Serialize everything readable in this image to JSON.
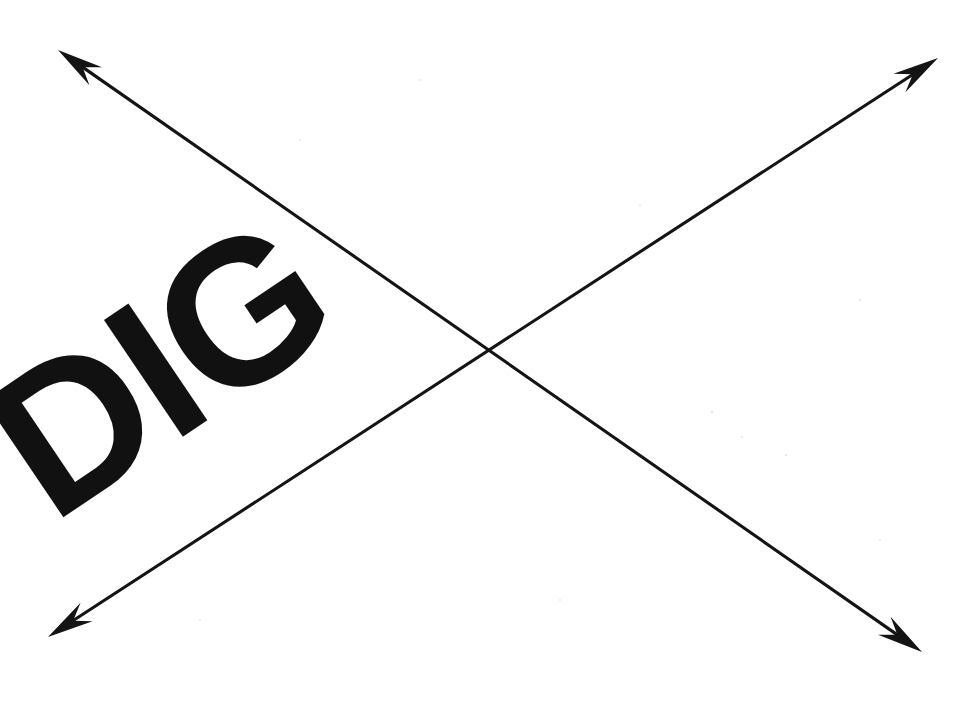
{
  "figure": {
    "title": "DIG",
    "background_color": "#ffffff",
    "ink_color": "#141414",
    "text": {
      "word": "DIG",
      "color": "#111111",
      "rotation_degrees": -34,
      "font_size_px": 205,
      "anchor_x": 52,
      "anchor_y": 525
    },
    "annotations": {
      "line_count": "2",
      "arrowhead_count": "4",
      "shape_description": "X",
      "line_width_px": "3"
    },
    "arrows": [
      {
        "name": "arrow-down-right",
        "label": "Descending diagonal double arrow",
        "x1": 58,
        "y1": 50,
        "x2": 922,
        "y2": 652,
        "double_headed": "true"
      },
      {
        "name": "arrow-up-right",
        "label": "Ascending diagonal double arrow",
        "x1": 48,
        "y1": 637,
        "x2": 938,
        "y2": 58,
        "double_headed": "true"
      }
    ],
    "crossing_point": {
      "x": 488,
      "y": 352,
      "label": "Intersection"
    },
    "specks": [
      {
        "x": 712,
        "y": 412,
        "r": 1.4
      },
      {
        "x": 786,
        "y": 455,
        "r": 1.2
      },
      {
        "x": 742,
        "y": 437,
        "r": 1.0
      },
      {
        "x": 640,
        "y": 205,
        "r": 1.1
      },
      {
        "x": 300,
        "y": 140,
        "r": 1.0
      },
      {
        "x": 860,
        "y": 300,
        "r": 1.2
      },
      {
        "x": 200,
        "y": 620,
        "r": 1.1
      },
      {
        "x": 560,
        "y": 600,
        "r": 1.0
      },
      {
        "x": 420,
        "y": 80,
        "r": 1.0
      },
      {
        "x": 880,
        "y": 540,
        "r": 1.1
      }
    ]
  }
}
